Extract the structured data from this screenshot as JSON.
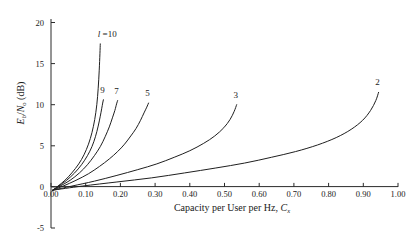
{
  "chart_data": {
    "type": "line",
    "title": "",
    "xlabel": "Capacity per User per Hz, C_x",
    "xlabel_main": "Capacity per User per Hz, C",
    "xlabel_sub": "x",
    "ylabel": "E_b/N_o (dB)",
    "ylabel_parts": {
      "e": "E",
      "e_sub": "b",
      "slash": "/",
      "n": "N",
      "n_sub": "o",
      "unit": "(dB)"
    },
    "xlim": [
      0.0,
      1.0
    ],
    "ylim": [
      -5,
      20
    ],
    "grid": false,
    "legend": "inline-curve-labels",
    "xticks": [
      "0.00",
      "0.10",
      "0.20",
      "0.30",
      "0.40",
      "0.50",
      "0.60",
      "0.70",
      "0.80",
      "0.90",
      "1.00"
    ],
    "xtick_values": [
      0.0,
      0.1,
      0.2,
      0.3,
      0.4,
      0.5,
      0.6,
      0.7,
      0.8,
      0.9,
      1.0
    ],
    "yticks": [
      "20",
      "15",
      "10",
      "5",
      "0",
      "-5"
    ],
    "ytick_values": [
      20,
      15,
      10,
      5,
      0,
      -5
    ],
    "series": [
      {
        "name": "l = 10",
        "label": "l =10",
        "label_italic_prefix": "l",
        "label_rest": " =10",
        "l": 10,
        "x": [
          0.005,
          0.02,
          0.04,
          0.06,
          0.08,
          0.095,
          0.108,
          0.118,
          0.126,
          0.132,
          0.136,
          0.139,
          0.141,
          0.142
        ],
        "y": [
          -0.4,
          0.1,
          0.8,
          1.7,
          2.8,
          3.9,
          5.2,
          6.6,
          8.2,
          10.0,
          12.0,
          14.2,
          16.2,
          17.4
        ]
      },
      {
        "name": "9",
        "label": "9",
        "l": 9,
        "x": [
          0.005,
          0.022,
          0.045,
          0.068,
          0.088,
          0.105,
          0.118,
          0.128,
          0.136,
          0.142,
          0.146,
          0.149,
          0.151
        ],
        "y": [
          -0.4,
          0.1,
          0.8,
          1.7,
          2.7,
          3.8,
          4.9,
          6.1,
          7.4,
          8.6,
          9.5,
          10.2,
          10.6
        ]
      },
      {
        "name": "7",
        "label": "7",
        "l": 7,
        "x": [
          0.005,
          0.026,
          0.055,
          0.082,
          0.105,
          0.125,
          0.142,
          0.156,
          0.168,
          0.177,
          0.184,
          0.189,
          0.192
        ],
        "y": [
          -0.4,
          0.1,
          0.8,
          1.7,
          2.7,
          3.8,
          4.9,
          6.1,
          7.3,
          8.4,
          9.3,
          10.1,
          10.5
        ]
      },
      {
        "name": "5",
        "label": "5",
        "l": 5,
        "x": [
          0.005,
          0.035,
          0.072,
          0.108,
          0.14,
          0.168,
          0.192,
          0.212,
          0.23,
          0.245,
          0.258,
          0.268,
          0.276,
          0.281
        ],
        "y": [
          -0.4,
          0.1,
          0.8,
          1.6,
          2.5,
          3.4,
          4.3,
          5.2,
          6.2,
          7.1,
          8.1,
          9.0,
          9.7,
          10.2
        ]
      },
      {
        "name": "3",
        "label": "3",
        "l": 3,
        "x": [
          0.005,
          0.06,
          0.125,
          0.19,
          0.25,
          0.305,
          0.355,
          0.4,
          0.44,
          0.472,
          0.498,
          0.516,
          0.528,
          0.535
        ],
        "y": [
          -0.4,
          0.1,
          0.7,
          1.4,
          2.1,
          2.8,
          3.6,
          4.4,
          5.3,
          6.2,
          7.2,
          8.2,
          9.2,
          10.0
        ]
      },
      {
        "name": "2",
        "label": "2",
        "l": 2,
        "x": [
          0.005,
          0.09,
          0.19,
          0.29,
          0.385,
          0.475,
          0.558,
          0.635,
          0.705,
          0.768,
          0.822,
          0.865,
          0.898,
          0.921,
          0.936,
          0.944
        ],
        "y": [
          -0.4,
          0.1,
          0.6,
          1.1,
          1.7,
          2.3,
          2.9,
          3.6,
          4.3,
          5.1,
          6.0,
          7.0,
          8.1,
          9.3,
          10.5,
          11.5
        ]
      }
    ],
    "colors": {
      "curve": "#1f1f1f",
      "axis": "#2b2b2b",
      "background": "#ffffff"
    }
  }
}
